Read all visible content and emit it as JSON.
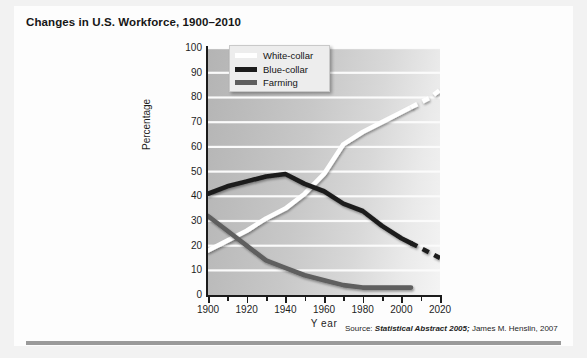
{
  "figure": {
    "title": "Changes in U.S. Workforce, 1900–2010",
    "source_lead": "Source:",
    "source_italic": "Statistical Abstract 2005;",
    "source_tail": "James M. Henslin, 2007"
  },
  "chart_data": {
    "type": "line",
    "title": "Changes in U.S. Workforce, 1900–2010",
    "xlabel": "Y ear",
    "ylabel": "Percentage",
    "xlim": [
      1900,
      2020
    ],
    "ylim": [
      0,
      100
    ],
    "grid": true,
    "legend_position": "top-left-inside",
    "x_ticks": [
      1900,
      1920,
      1940,
      1960,
      1980,
      2000,
      2020
    ],
    "x_minor_ticks": [
      1910,
      1930,
      1950,
      1970,
      1990,
      2010
    ],
    "y_ticks": [
      100,
      90,
      80,
      70,
      60,
      50,
      40,
      30,
      20,
      10,
      0
    ],
    "series": [
      {
        "name": "White-collar",
        "color": "#ffffff",
        "x": [
          1900,
          1910,
          1920,
          1930,
          1940,
          1950,
          1960,
          1970,
          1980,
          1990,
          2000,
          2005
        ],
        "values": [
          18,
          22,
          26,
          31,
          35,
          41,
          49,
          61,
          66,
          70,
          74,
          76
        ],
        "projection": {
          "style": "dashed",
          "x": [
            2005,
            2010,
            2015,
            2020
          ],
          "values": [
            76,
            78,
            80,
            83
          ]
        }
      },
      {
        "name": "Blue-collar",
        "color": "#1c1c1c",
        "x": [
          1900,
          1910,
          1920,
          1930,
          1940,
          1950,
          1960,
          1970,
          1980,
          1990,
          2000,
          2005
        ],
        "values": [
          41,
          44,
          46,
          48,
          49,
          45,
          42,
          37,
          34,
          28,
          23,
          21
        ],
        "projection": {
          "style": "dashed",
          "x": [
            2005,
            2010,
            2015,
            2020
          ],
          "values": [
            21,
            19,
            17,
            15
          ]
        }
      },
      {
        "name": "Farming",
        "color": "#5e5e5e",
        "x": [
          1900,
          1910,
          1920,
          1930,
          1940,
          1950,
          1960,
          1970,
          1980,
          1990,
          2000,
          2005
        ],
        "values": [
          32,
          26,
          20,
          14,
          11,
          8,
          6,
          4,
          3,
          3,
          3,
          3
        ],
        "projection": {
          "style": "dashed",
          "x": [
            2005,
            2010,
            2015,
            2020
          ],
          "values": [
            3,
            3,
            3,
            3
          ]
        }
      }
    ]
  }
}
